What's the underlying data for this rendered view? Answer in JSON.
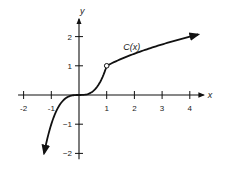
{
  "chart_data": {
    "type": "line",
    "title": "",
    "xlabel": "x",
    "ylabel": "y",
    "xlim": [
      -2.2,
      4.6
    ],
    "ylim": [
      -2.2,
      2.7
    ],
    "grid": false,
    "x_ticks": [
      -2,
      -1,
      1,
      2,
      3,
      4
    ],
    "y_ticks": [
      -2,
      -1,
      1,
      2
    ],
    "x_tick_labels": [
      "-2",
      "-1",
      "1",
      "2",
      "3",
      "4"
    ],
    "y_tick_labels": [
      "−2",
      "−1",
      "1",
      "2"
    ],
    "series": [
      {
        "name": "C(x)",
        "description": "Piecewise: x^3 for x < 1, sqrt(x) for x > 1; open circle at (1, 1)",
        "pieces": [
          {
            "domain": [
              -1.26,
              1
            ],
            "formula": "x^3",
            "arrow_start": true
          },
          {
            "domain": [
              1,
              4.3
            ],
            "formula": "sqrt(x)",
            "arrow_end": true
          }
        ],
        "x": [
          -1.26,
          -1,
          -0.5,
          0,
          0.5,
          1,
          2,
          3,
          4,
          4.3
        ],
        "values": [
          -2.0,
          -1.0,
          -0.125,
          0,
          0.125,
          1.0,
          1.41,
          1.73,
          2.0,
          2.07
        ]
      }
    ],
    "annotations": [
      {
        "text": "C(x)",
        "x": 1.6,
        "y": 1.55
      },
      {
        "type": "open-circle",
        "x": 1,
        "y": 1
      }
    ],
    "legend": null
  }
}
